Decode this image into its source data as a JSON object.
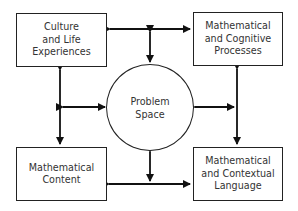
{
  "diagram": {
    "center": {
      "label": "Problem\nSpace"
    },
    "nodes": [
      {
        "id": "top-left",
        "label": "Culture\nand Life\nExperiences"
      },
      {
        "id": "top-right",
        "label": "Mathematical\nand Cognitive\nProcesses"
      },
      {
        "id": "bottom-left",
        "label": "Mathematical\nContent"
      },
      {
        "id": "bottom-right",
        "label": "Mathematical\nand Contextual\nLanguage"
      }
    ],
    "edges": [
      {
        "from": "top-left",
        "to": "top-right",
        "type": "bidirectional"
      },
      {
        "from": "bottom-left",
        "to": "bottom-right",
        "type": "bidirectional"
      },
      {
        "from": "top-left",
        "to": "bottom-left",
        "type": "bidirectional"
      },
      {
        "from": "top-right",
        "to": "bottom-right",
        "type": "bidirectional"
      },
      {
        "from": "center",
        "to": "top-edge",
        "type": "bidirectional"
      },
      {
        "from": "center",
        "to": "bottom-edge",
        "type": "bidirectional"
      },
      {
        "from": "center",
        "to": "left-edge",
        "type": "bidirectional"
      },
      {
        "from": "center",
        "to": "right-edge",
        "type": "bidirectional"
      }
    ]
  }
}
